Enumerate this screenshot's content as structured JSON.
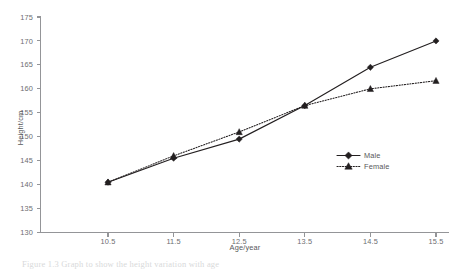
{
  "figure": {
    "caption": "Figure 1.3 Graph to show the height variation with age",
    "background": "#ffffff",
    "ink_color": "#231f20",
    "axis_color": "#949598",
    "label_color": "#6d6e70"
  },
  "chart_data": {
    "type": "line",
    "title": "",
    "xlabel": "Age/year",
    "ylabel": "Height/cm",
    "x": [
      10.5,
      11.5,
      12.5,
      13.5,
      14.5,
      15.5
    ],
    "xticklabels": [
      "10.5",
      "11.5",
      "12.5",
      "13.5",
      "14.5",
      "15.5"
    ],
    "yticks": [
      130,
      135,
      140,
      145,
      150,
      155,
      160,
      165,
      170,
      175
    ],
    "yticklabels": [
      "130",
      "135",
      "140",
      "145",
      "150",
      "155",
      "160",
      "165",
      "170",
      "175"
    ],
    "xlim": [
      10.0,
      16.0
    ],
    "ylim": [
      130,
      175
    ],
    "grid": false,
    "legend_position": "center-right",
    "series": [
      {
        "name": "Male",
        "marker": "diamond",
        "linestyle": "solid",
        "color": "#231f20",
        "values": [
          140.5,
          145.5,
          149.5,
          156.5,
          164.5,
          170.0
        ]
      },
      {
        "name": "Female",
        "marker": "triangle",
        "linestyle": "dotted",
        "color": "#231f20",
        "values": [
          140.5,
          146.0,
          151.0,
          156.5,
          160.0,
          161.7
        ]
      }
    ]
  }
}
